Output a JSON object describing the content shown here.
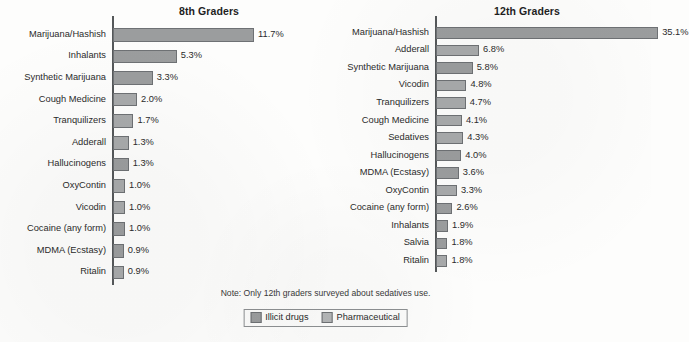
{
  "note": "Note: Only 12th graders surveyed about sedatives use.",
  "legend": {
    "items": [
      {
        "label": "Illicit drugs",
        "key": "illicit",
        "color": "#9b9d9e"
      },
      {
        "label": "Pharmaceutical",
        "key": "pharma",
        "color": "#b4b6b7"
      }
    ]
  },
  "chart_data": [
    {
      "type": "bar",
      "orientation": "horizontal",
      "title": "8th Graders",
      "xlabel": "",
      "ylabel": "",
      "xlim": [
        0,
        12.5
      ],
      "grid": false,
      "legend_position": "bottom-center",
      "categories": [
        "Marijuana/Hashish",
        "Inhalants",
        "Synthetic Marijuana",
        "Cough Medicine",
        "Tranquilizers",
        "Adderall",
        "Hallucinogens",
        "OxyContin",
        "Vicodin",
        "Cocaine (any form)",
        "MDMA (Ecstasy)",
        "Ritalin"
      ],
      "values": [
        11.7,
        5.3,
        3.3,
        2.0,
        1.7,
        1.3,
        1.3,
        1.0,
        1.0,
        1.0,
        0.9,
        0.9
      ],
      "value_labels": [
        "11.7%",
        "5.3%",
        "3.3%",
        "2.0%",
        "1.7%",
        "1.3%",
        "1.3%",
        "1.0%",
        "1.0%",
        "1.0%",
        "0.9%",
        "0.9%"
      ],
      "groups": [
        "illicit",
        "illicit",
        "illicit",
        "pharma",
        "pharma",
        "pharma",
        "illicit",
        "pharma",
        "pharma",
        "illicit",
        "illicit",
        "pharma"
      ]
    },
    {
      "type": "bar",
      "orientation": "horizontal",
      "title": "12th Graders",
      "xlabel": "",
      "ylabel": "",
      "xlim": [
        0,
        37
      ],
      "grid": false,
      "legend_position": "bottom-center",
      "categories": [
        "Marijuana/Hashish",
        "Adderall",
        "Synthetic Marijuana",
        "Vicodin",
        "Tranquilizers",
        "Cough Medicine",
        "Sedatives",
        "Hallucinogens",
        "MDMA (Ecstasy)",
        "OxyContin",
        "Cocaine (any form)",
        "Inhalants",
        "Salvia",
        "Ritalin"
      ],
      "values": [
        35.1,
        6.8,
        5.8,
        4.8,
        4.7,
        4.1,
        4.3,
        4.0,
        3.6,
        3.3,
        2.6,
        1.9,
        1.8,
        1.8
      ],
      "value_labels": [
        "35.1%",
        "6.8%",
        "5.8%",
        "4.8%",
        "4.7%",
        "4.1%",
        "4.3%",
        "4.0%",
        "3.6%",
        "3.3%",
        "2.6%",
        "1.9%",
        "1.8%",
        "1.8%"
      ],
      "groups": [
        "illicit",
        "pharma",
        "illicit",
        "pharma",
        "pharma",
        "pharma",
        "pharma",
        "illicit",
        "illicit",
        "pharma",
        "illicit",
        "illicit",
        "illicit",
        "pharma"
      ]
    }
  ]
}
